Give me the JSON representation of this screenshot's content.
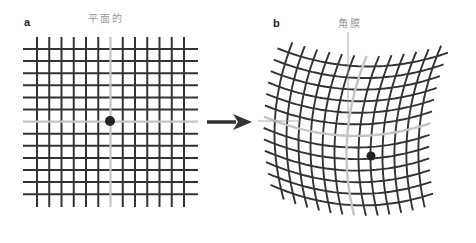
{
  "panels": {
    "a": {
      "label": "a",
      "caption": "平面的",
      "grid_lines": 13
    },
    "b": {
      "label": "b",
      "caption": "角膜",
      "grid_lines": 13
    }
  },
  "colors": {
    "grid": "#333333",
    "highlight": "#c4c4c4",
    "guide": "#9a9a9a",
    "dot": "#222222",
    "arrow": "#333333"
  },
  "arrow": {
    "direction": "right"
  }
}
